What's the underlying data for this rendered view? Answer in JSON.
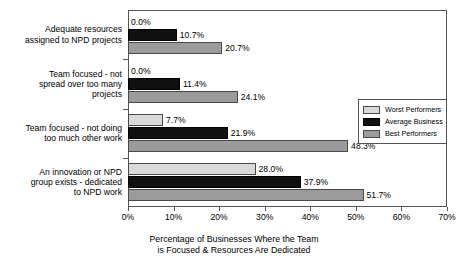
{
  "chart_data": {
    "type": "bar",
    "orientation": "horizontal",
    "title": "",
    "xlabel": "Percentage of Businesses Where the Team is Focused & Resources Are Dedicated",
    "ylabel": "",
    "xlim": [
      0,
      70
    ],
    "xticks": [
      "0%",
      "10%",
      "20%",
      "30%",
      "40%",
      "50%",
      "60%",
      "70%"
    ],
    "xtick_values": [
      0,
      10,
      20,
      30,
      40,
      50,
      60,
      70
    ],
    "grid": false,
    "legend_position": "center-right",
    "categories": [
      "Adequate resources assigned to NPD projects",
      "Team focused - not spread over too many projects",
      "Team focused - not doing too much other work",
      "An innovation or NPD group exists - dedicated to NPD work"
    ],
    "series": [
      {
        "name": "Worst Performers",
        "color": "#d9d9d9",
        "values": [
          0.0,
          0.0,
          7.7,
          28.0
        ],
        "labels": [
          "0.0%",
          "0.0%",
          "7.7%",
          "28.0%"
        ]
      },
      {
        "name": "Average Business",
        "color": "#101010",
        "values": [
          10.7,
          11.4,
          21.9,
          37.9
        ],
        "labels": [
          "10.7%",
          "11.4%",
          "21.9%",
          "37.9%"
        ]
      },
      {
        "name": "Best Performers",
        "color": "#9b9b9b",
        "values": [
          20.7,
          24.1,
          48.3,
          51.7
        ],
        "labels": [
          "20.7%",
          "24.1%",
          "48.3%",
          "51.7%"
        ]
      }
    ]
  },
  "caption": {
    "line1": "Percentage of Businesses Where the Team",
    "line2": "is Focused & Resources Are Dedicated"
  },
  "category_labels": [
    [
      "Adequate resources",
      "assigned to NPD projects"
    ],
    [
      "Team focused - not",
      "spread over too many",
      "projects"
    ],
    [
      "Team focused - not doing",
      "too much other work"
    ],
    [
      "An innovation or NPD",
      "group exists - dedicated",
      "to NPD work"
    ]
  ],
  "legend": {
    "items": [
      {
        "label": "Worst Performers"
      },
      {
        "label": "Average Business"
      },
      {
        "label": "Best Performers"
      }
    ]
  }
}
